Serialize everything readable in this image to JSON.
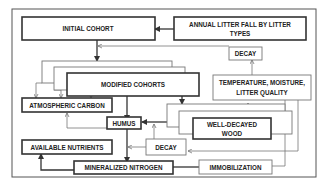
{
  "diagram": {
    "nodes": {
      "initial_cohort": "INITIAL COHORT",
      "annual_litter_fall_1": "ANNUAL LITTER FALL BY LITTER",
      "annual_litter_fall_2": "TYPES",
      "decay_top": "DECAY",
      "modified_cohorts": "MODIFIED COHORTS",
      "temperature_1": "TEMPERATURE, MOISTURE,",
      "temperature_2": "LITTER QUALITY",
      "atmospheric_carbon": "ATMOSPHERIC CARBON",
      "humus": "HUMUS",
      "well_decayed_wood_1": "WELL-DECAYED",
      "well_decayed_wood_2": "WOOD",
      "available_nutrients": "AVAILABLE NUTRIENTS",
      "decay_bottom": "DECAY",
      "mineralized_nitrogen": "MINERALIZED NITROGEN",
      "immobilization": "IMMOBILIZATION"
    },
    "edges": [
      {
        "from": "ANNUAL LITTER FALL BY LITTER TYPES",
        "to": "INITIAL COHORT"
      },
      {
        "from": "INITIAL COHORT",
        "to": "MODIFIED COHORTS"
      },
      {
        "from": "TEMPERATURE, MOISTURE, LITTER QUALITY",
        "to": "DECAY"
      },
      {
        "from": "DECAY",
        "to": "INITIAL COHORT"
      },
      {
        "from": "MODIFIED COHORTS",
        "to": "ATMOSPHERIC CARBON"
      },
      {
        "from": "MODIFIED COHORTS",
        "to": "HUMUS"
      },
      {
        "from": "MODIFIED COHORTS",
        "to": "WELL-DECAYED WOOD"
      },
      {
        "from": "WELL-DECAYED WOOD",
        "to": "HUMUS"
      },
      {
        "from": "HUMUS",
        "to": "ATMOSPHERIC CARBON"
      },
      {
        "from": "HUMUS",
        "to": "MINERALIZED NITROGEN"
      },
      {
        "from": "DECAY",
        "to": "HUMUS"
      },
      {
        "from": "DECAY",
        "to": "MINERALIZED NITROGEN"
      },
      {
        "from": "TEMPERATURE, MOISTURE, LITTER QUALITY",
        "to": "DECAY"
      },
      {
        "from": "TEMPERATURE, MOISTURE, LITTER QUALITY",
        "to": "WELL-DECAYED WOOD"
      },
      {
        "from": "MINERALIZED NITROGEN",
        "to": "AVAILABLE NUTRIENTS"
      },
      {
        "from": "MINERALIZED NITROGEN",
        "to": "IMMOBILIZATION"
      }
    ]
  }
}
